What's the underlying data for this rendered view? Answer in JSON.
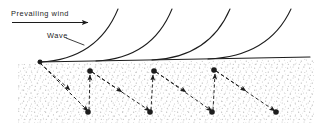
{
  "figure": {
    "name": "wave-sediment-transport-diagram",
    "width": 314,
    "height": 123,
    "background_color": "#ffffff",
    "ink_color": "#1c1c1c",
    "stipple_color": "#b9b9b9"
  },
  "labels": {
    "prevailing_wind": "Prevailing wind",
    "wave": "Wave"
  },
  "wind_arrow": {
    "name": "prevailing-wind-arrow",
    "x1": 12,
    "y1": 22.5,
    "x2": 88,
    "y2": 22.5,
    "color": "#1c1c1c"
  },
  "wave_leader_line": {
    "name": "wave-leader-line",
    "x1": 66,
    "y1": 38,
    "x2": 84,
    "y2": 45
  },
  "baseline": {
    "name": "water-surface-baseline",
    "x1": 38,
    "y1": 62,
    "x2": 310,
    "y2": 57,
    "color": "#1c1c1c"
  },
  "sediment": {
    "name": "sediment-layer",
    "top_y": 63,
    "bottom_y": 123,
    "left_x": 18,
    "right_x": 314,
    "fill": "#ffffff",
    "stipple_color": "#b9b9b9"
  },
  "waves": [
    {
      "base_x": 40,
      "base_y": 62,
      "tip_x": 118,
      "tip_y": 9
    },
    {
      "base_x": 96,
      "base_y": 61,
      "tip_x": 172,
      "tip_y": 9
    },
    {
      "base_x": 152,
      "base_y": 60,
      "tip_x": 230,
      "tip_y": 9
    },
    {
      "base_x": 208,
      "base_y": 59,
      "tip_x": 291,
      "tip_y": 9
    }
  ],
  "orbital_dots": [
    {
      "x": 40,
      "y": 62,
      "r": 2.4
    },
    {
      "x": 90,
      "y": 71,
      "r": 2.8
    },
    {
      "x": 88,
      "y": 112,
      "r": 2.8
    },
    {
      "x": 154,
      "y": 71,
      "r": 2.8
    },
    {
      "x": 150,
      "y": 112,
      "r": 2.8
    },
    {
      "x": 214,
      "y": 70,
      "r": 2.8
    },
    {
      "x": 212,
      "y": 112,
      "r": 2.8
    },
    {
      "x": 276,
      "y": 112,
      "r": 2.8
    }
  ],
  "diagonal_arrows": [
    {
      "x1": 40,
      "y1": 63,
      "x2": 70,
      "y2": 90
    },
    {
      "x1": 40,
      "y1": 63,
      "x2": 88,
      "y2": 111
    },
    {
      "x1": 92,
      "y1": 72,
      "x2": 122,
      "y2": 92
    },
    {
      "x1": 92,
      "y1": 72,
      "x2": 150,
      "y2": 111
    },
    {
      "x1": 156,
      "y1": 72,
      "x2": 186,
      "y2": 92
    },
    {
      "x1": 156,
      "y1": 72,
      "x2": 212,
      "y2": 111
    },
    {
      "x1": 216,
      "y1": 71,
      "x2": 246,
      "y2": 91
    },
    {
      "x1": 216,
      "y1": 71,
      "x2": 275,
      "y2": 111
    }
  ],
  "vertical_arrows": [
    {
      "x1": 89,
      "y1": 110,
      "x2": 90,
      "y2": 75
    },
    {
      "x1": 151,
      "y1": 110,
      "x2": 153,
      "y2": 75
    },
    {
      "x1": 213,
      "y1": 110,
      "x2": 215,
      "y2": 74
    }
  ]
}
